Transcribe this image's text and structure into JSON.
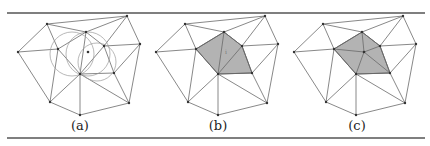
{
  "figure": {
    "panels": [
      {
        "id": "a",
        "caption": "(a)",
        "offset_x": 0,
        "shaded": false,
        "circles": true,
        "inserted_point": false
      },
      {
        "id": "b",
        "caption": "(b)",
        "offset_x": 138,
        "shaded": true,
        "circles": false,
        "inserted_point": false,
        "cavity_label": "i"
      },
      {
        "id": "c",
        "caption": "(c)",
        "offset_x": 276,
        "shaded": true,
        "circles": false,
        "inserted_point": true
      }
    ],
    "vertices": {
      "A": [
        47,
        24
      ],
      "B": [
        127,
        16
      ],
      "C": [
        18,
        52
      ],
      "D": [
        58,
        49
      ],
      "E": [
        86,
        32
      ],
      "F": [
        104,
        46
      ],
      "G": [
        80,
        74
      ],
      "H": [
        114,
        73
      ],
      "I": [
        140,
        44
      ],
      "J": [
        50,
        102
      ],
      "K": [
        80,
        115
      ],
      "L": [
        129,
        103
      ]
    },
    "new_point": [
      88,
      52
    ],
    "edges": [
      [
        "A",
        "B"
      ],
      [
        "A",
        "C"
      ],
      [
        "A",
        "D"
      ],
      [
        "A",
        "E"
      ],
      [
        "B",
        "E"
      ],
      [
        "B",
        "F"
      ],
      [
        "B",
        "I"
      ],
      [
        "C",
        "D"
      ],
      [
        "C",
        "J"
      ],
      [
        "D",
        "E"
      ],
      [
        "D",
        "G"
      ],
      [
        "D",
        "J"
      ],
      [
        "E",
        "F"
      ],
      [
        "E",
        "G"
      ],
      [
        "F",
        "G"
      ],
      [
        "F",
        "H"
      ],
      [
        "F",
        "I"
      ],
      [
        "H",
        "I"
      ],
      [
        "H",
        "L"
      ],
      [
        "I",
        "L"
      ],
      [
        "G",
        "H"
      ],
      [
        "G",
        "J"
      ],
      [
        "G",
        "K"
      ],
      [
        "G",
        "L"
      ],
      [
        "J",
        "K"
      ],
      [
        "K",
        "L"
      ]
    ],
    "cavity_polygon": [
      "D",
      "E",
      "F",
      "H",
      "G"
    ],
    "cavity_internal_edges": [
      [
        "E",
        "G"
      ],
      [
        "F",
        "G"
      ]
    ],
    "circumcircles": [
      {
        "cx": 72,
        "cy": 54,
        "r": 22
      },
      {
        "cx": 88,
        "cy": 54,
        "r": 22
      },
      {
        "cx": 97,
        "cy": 62,
        "r": 19
      }
    ],
    "colors": {
      "shade": "#b3b3b3",
      "edge": "#6a6a6a",
      "circle": "#9a9a9a",
      "rule": "#555555"
    },
    "rules": {
      "top_y": 13,
      "bottom_y": 138,
      "x1": 7,
      "x2": 425
    }
  }
}
